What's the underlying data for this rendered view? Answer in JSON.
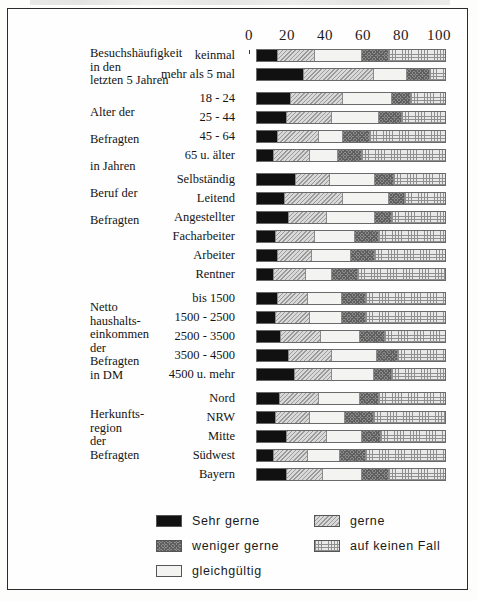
{
  "axis": {
    "ticks": [
      0,
      20,
      40,
      60,
      80,
      100
    ],
    "min": 0,
    "max": 100
  },
  "groups": [
    {
      "name": "besuchshaeufigkeit",
      "label": "Besuchshäufigkeit\nin den\nletzten 5 Jahren"
    },
    {
      "name": "alter",
      "label": "Alter der\n\nBefragten\n\nin Jahren"
    },
    {
      "name": "beruf",
      "label": "Beruf der\n\nBefragten"
    },
    {
      "name": "einkommen",
      "label": "Netto\nhaushalts-\neinkommen\nder\nBefragten\nin DM"
    },
    {
      "name": "herkunft",
      "label": "Herkunfts-\nregion\nder\nBefragten"
    }
  ],
  "legend": {
    "items": [
      {
        "key": "sehr_gerne",
        "label": "Sehr gerne",
        "pattern": "solid-black",
        "color": "#111111"
      },
      {
        "key": "gerne",
        "label": "gerne",
        "pattern": "light-hatch",
        "color": "#d9d9d9"
      },
      {
        "key": "weniger_gerne",
        "label": "weniger gerne",
        "pattern": "dark-stipple",
        "color": "#8c8c8c"
      },
      {
        "key": "auf_keinen_fall",
        "label": "auf keinen Fall",
        "pattern": "grid-crosshatch",
        "color": "#e8e8e8"
      },
      {
        "key": "gleichgueltig",
        "label": "gleichgültig",
        "pattern": "blank-white",
        "color": "#f3f3f1"
      }
    ]
  },
  "chart_data": {
    "type": "bar",
    "orientation": "horizontal",
    "stacked": true,
    "title": "",
    "xlabel": "",
    "ylabel": "",
    "xlim": [
      0,
      100
    ],
    "grid": false,
    "legend_position": "bottom",
    "series": [
      {
        "name": "Sehr gerne",
        "values": [
          11,
          25,
          18,
          16,
          11,
          9,
          21,
          15,
          17,
          10,
          11,
          9,
          11,
          10,
          13,
          17,
          20,
          12,
          10,
          16,
          9,
          16
        ]
      },
      {
        "name": "gerne",
        "values": [
          20,
          37,
          28,
          24,
          22,
          19,
          18,
          31,
          20,
          21,
          18,
          17,
          16,
          18,
          21,
          23,
          20,
          21,
          18,
          21,
          18,
          19
        ]
      },
      {
        "name": "gleichgültig",
        "values": [
          25,
          18,
          26,
          25,
          13,
          15,
          24,
          24,
          26,
          21,
          21,
          14,
          18,
          17,
          21,
          24,
          22,
          22,
          19,
          19,
          17,
          21
        ]
      },
      {
        "name": "weniger gerne",
        "values": [
          14,
          12,
          10,
          12,
          14,
          13,
          10,
          9,
          9,
          13,
          13,
          14,
          13,
          13,
          13,
          11,
          10,
          10,
          15,
          10,
          14,
          14
        ]
      },
      {
        "name": "auf keinen Fall",
        "values": [
          30,
          8,
          18,
          23,
          40,
          44,
          27,
          21,
          28,
          35,
          37,
          46,
          42,
          42,
          32,
          25,
          28,
          35,
          38,
          34,
          42,
          30
        ]
      }
    ],
    "categories": [
      "keinmal",
      "mehr als 5 mal",
      "18 - 24",
      "25 - 44",
      "45 - 64",
      "65 u. älter",
      "Selbständig",
      "Leitend",
      "Angestellter",
      "Facharbeiter",
      "Arbeiter",
      "Rentner",
      "bis 1500",
      "1500 - 2500",
      "2500 - 3500",
      "3500 - 4500",
      "4500 u. mehr",
      "Nord",
      "NRW",
      "Mitte",
      "Südwest",
      "Bayern"
    ],
    "rows": [
      {
        "category": "keinmal",
        "group": "besuchshaeufigkeit",
        "values": [
          11,
          20,
          25,
          14,
          30
        ]
      },
      {
        "category": "mehr als 5 mal",
        "group": "besuchshaeufigkeit",
        "values": [
          25,
          37,
          18,
          12,
          8
        ]
      },
      {
        "category": "18 - 24",
        "group": "alter",
        "values": [
          18,
          28,
          26,
          10,
          18
        ]
      },
      {
        "category": "25 - 44",
        "group": "alter",
        "values": [
          16,
          24,
          25,
          12,
          23
        ]
      },
      {
        "category": "45 - 64",
        "group": "alter",
        "values": [
          11,
          22,
          13,
          14,
          40
        ]
      },
      {
        "category": "65 u. älter",
        "group": "alter",
        "values": [
          9,
          19,
          15,
          13,
          44
        ]
      },
      {
        "category": "Selbständig",
        "group": "beruf",
        "values": [
          21,
          18,
          24,
          10,
          27
        ]
      },
      {
        "category": "Leitend",
        "group": "beruf",
        "values": [
          15,
          31,
          24,
          9,
          21
        ]
      },
      {
        "category": "Angestellter",
        "group": "beruf",
        "values": [
          17,
          20,
          26,
          9,
          28
        ]
      },
      {
        "category": "Facharbeiter",
        "group": "beruf",
        "values": [
          10,
          21,
          21,
          13,
          35
        ]
      },
      {
        "category": "Arbeiter",
        "group": "beruf",
        "values": [
          11,
          18,
          21,
          13,
          37
        ]
      },
      {
        "category": "Rentner",
        "group": "beruf",
        "values": [
          9,
          17,
          14,
          14,
          46
        ]
      },
      {
        "category": "bis 1500",
        "group": "einkommen",
        "values": [
          11,
          16,
          18,
          13,
          42
        ]
      },
      {
        "category": "1500 - 2500",
        "group": "einkommen",
        "values": [
          10,
          18,
          17,
          13,
          42
        ]
      },
      {
        "category": "2500 - 3500",
        "group": "einkommen",
        "values": [
          13,
          21,
          21,
          13,
          32
        ]
      },
      {
        "category": "3500 - 4500",
        "group": "einkommen",
        "values": [
          17,
          23,
          24,
          11,
          25
        ]
      },
      {
        "category": "4500 u. mehr",
        "group": "einkommen",
        "values": [
          20,
          20,
          22,
          10,
          28
        ]
      },
      {
        "category": "Nord",
        "group": "herkunft",
        "values": [
          12,
          21,
          22,
          10,
          35
        ]
      },
      {
        "category": "NRW",
        "group": "herkunft",
        "values": [
          10,
          18,
          19,
          15,
          38
        ]
      },
      {
        "category": "Mitte",
        "group": "herkunft",
        "values": [
          16,
          21,
          19,
          10,
          34
        ]
      },
      {
        "category": "Südwest",
        "group": "herkunft",
        "values": [
          9,
          18,
          17,
          14,
          42
        ]
      },
      {
        "category": "Bayern",
        "group": "herkunft",
        "values": [
          16,
          19,
          21,
          14,
          30
        ]
      }
    ]
  }
}
